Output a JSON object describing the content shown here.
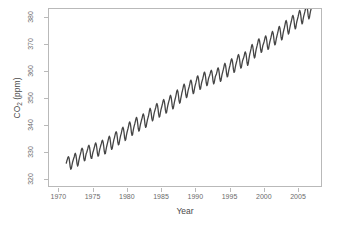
{
  "chart_data": {
    "type": "line",
    "title": "",
    "xlabel": "Year",
    "ylabel": "CO2 (ppm)",
    "ylabel_parts": {
      "base": "CO",
      "sub": "2",
      "unit": " (ppm)"
    },
    "xlim": [
      1968.5,
      2008.5
    ],
    "ylim": [
      317.0,
      383.5
    ],
    "xticks": [
      1970,
      1975,
      1980,
      1985,
      1990,
      1995,
      2000,
      2005
    ],
    "xtick_labels": [
      "1970",
      "1975",
      "1980",
      "1985",
      "1990",
      "1995",
      "2000",
      "2005"
    ],
    "yticks": [
      320,
      330,
      340,
      350,
      360,
      370,
      380
    ],
    "ytick_labels": [
      "320",
      "330",
      "340",
      "350",
      "360",
      "370",
      "380"
    ],
    "grid": false,
    "legend": null,
    "series": [
      {
        "name": "Atmospheric CO2 concentration (Mauna Loa monthly mean)",
        "color": "#454545",
        "line_width": 1.3,
        "marker": "none",
        "x": [
          1971.04,
          1971.12,
          1971.21,
          1971.29,
          1971.37,
          1971.46,
          1971.54,
          1971.62,
          1971.71,
          1971.79,
          1971.87,
          1971.96,
          1972.04,
          1972.12,
          1972.21,
          1972.29,
          1972.37,
          1972.46,
          1972.54,
          1972.62,
          1972.71,
          1972.79,
          1972.87,
          1972.96,
          1973.04,
          1973.12,
          1973.21,
          1973.29,
          1973.37,
          1973.46,
          1973.54,
          1973.62,
          1973.71,
          1973.79,
          1973.87,
          1973.96,
          1974.04,
          1974.12,
          1974.21,
          1974.29,
          1974.37,
          1974.46,
          1974.54,
          1974.62,
          1974.71,
          1974.79,
          1974.87,
          1974.96,
          1975.04,
          1975.12,
          1975.21,
          1975.29,
          1975.37,
          1975.46,
          1975.54,
          1975.62,
          1975.71,
          1975.79,
          1975.87,
          1975.96,
          1976.04,
          1976.12,
          1976.21,
          1976.29,
          1976.37,
          1976.46,
          1976.54,
          1976.62,
          1976.71,
          1976.79,
          1976.87,
          1976.96,
          1977.04,
          1977.12,
          1977.21,
          1977.29,
          1977.37,
          1977.46,
          1977.54,
          1977.62,
          1977.71,
          1977.79,
          1977.87,
          1977.96,
          1978.04,
          1978.12,
          1978.21,
          1978.29,
          1978.37,
          1978.46,
          1978.54,
          1978.62,
          1978.71,
          1978.79,
          1978.87,
          1978.96,
          1979.04,
          1979.12,
          1979.21,
          1979.29,
          1979.37,
          1979.46,
          1979.54,
          1979.62,
          1979.71,
          1979.79,
          1979.87,
          1979.96,
          1980.04,
          1980.12,
          1980.21,
          1980.29,
          1980.37,
          1980.46,
          1980.54,
          1980.62,
          1980.71,
          1980.79,
          1980.87,
          1980.96,
          1981.04,
          1981.12,
          1981.21,
          1981.29,
          1981.37,
          1981.46,
          1981.54,
          1981.62,
          1981.71,
          1981.79,
          1981.87,
          1981.96,
          1982.04,
          1982.12,
          1982.21,
          1982.29,
          1982.37,
          1982.46,
          1982.54,
          1982.62,
          1982.71,
          1982.79,
          1982.87,
          1982.96,
          1983.04,
          1983.12,
          1983.21,
          1983.29,
          1983.37,
          1983.46,
          1983.54,
          1983.62,
          1983.71,
          1983.79,
          1983.87,
          1983.96,
          1984.04,
          1984.12,
          1984.21,
          1984.29,
          1984.37,
          1984.46,
          1984.54,
          1984.62,
          1984.71,
          1984.79,
          1984.87,
          1984.96,
          1985.04,
          1985.12,
          1985.21,
          1985.29,
          1985.37,
          1985.46,
          1985.54,
          1985.62,
          1985.71,
          1985.79,
          1985.87,
          1985.96,
          1986.04,
          1986.12,
          1986.21,
          1986.29,
          1986.37,
          1986.46,
          1986.54,
          1986.62,
          1986.71,
          1986.79,
          1986.87,
          1986.96,
          1987.04,
          1987.12,
          1987.21,
          1987.29,
          1987.37,
          1987.46,
          1987.54,
          1987.62,
          1987.71,
          1987.79,
          1987.87,
          1987.96,
          1988.04,
          1988.12,
          1988.21,
          1988.29,
          1988.37,
          1988.46,
          1988.54,
          1988.62,
          1988.71,
          1988.79,
          1988.87,
          1988.96,
          1989.04,
          1989.12,
          1989.21,
          1989.29,
          1989.37,
          1989.46,
          1989.54,
          1989.62,
          1989.71,
          1989.79,
          1989.87,
          1989.96,
          1990.04,
          1990.12,
          1990.21,
          1990.29,
          1990.37,
          1990.46,
          1990.54,
          1990.62,
          1990.71,
          1990.79,
          1990.87,
          1990.96,
          1991.04,
          1991.12,
          1991.21,
          1991.29,
          1991.37,
          1991.46,
          1991.54,
          1991.62,
          1991.71,
          1991.79,
          1991.87,
          1991.96,
          1992.04,
          1992.12,
          1992.21,
          1992.29,
          1992.37,
          1992.46,
          1992.54,
          1992.62,
          1992.71,
          1992.79,
          1992.87,
          1992.96,
          1993.04,
          1993.12,
          1993.21,
          1993.29,
          1993.37,
          1993.46,
          1993.54,
          1993.62,
          1993.71,
          1993.79,
          1993.87,
          1993.96,
          1994.04,
          1994.12,
          1994.21,
          1994.29,
          1994.37,
          1994.46,
          1994.54,
          1994.62,
          1994.71,
          1994.79,
          1994.87,
          1994.96,
          1995.04,
          1995.12,
          1995.21,
          1995.29,
          1995.37,
          1995.46,
          1995.54,
          1995.62,
          1995.71,
          1995.79,
          1995.87,
          1995.96,
          1996.04,
          1996.12,
          1996.21,
          1996.29,
          1996.37,
          1996.46,
          1996.54,
          1996.62,
          1996.71,
          1996.79,
          1996.87,
          1996.96,
          1997.04,
          1997.12,
          1997.21,
          1997.29,
          1997.37,
          1997.46,
          1997.54,
          1997.62,
          1997.71,
          1997.79,
          1997.87,
          1997.96,
          1998.04,
          1998.12,
          1998.21,
          1998.29,
          1998.37,
          1998.46,
          1998.54,
          1998.62,
          1998.71,
          1998.79,
          1998.87,
          1998.96,
          1999.04,
          1999.12,
          1999.21,
          1999.29,
          1999.37,
          1999.46,
          1999.54,
          1999.62,
          1999.71,
          1999.79,
          1999.87,
          1999.96,
          2000.04,
          2000.12,
          2000.21,
          2000.29,
          2000.37,
          2000.46,
          2000.54,
          2000.62,
          2000.71,
          2000.79,
          2000.87,
          2000.96,
          2001.04,
          2001.12,
          2001.21,
          2001.29,
          2001.37,
          2001.46,
          2001.54,
          2001.62,
          2001.71,
          2001.79,
          2001.87,
          2001.96,
          2002.04,
          2002.12,
          2002.21,
          2002.29,
          2002.37,
          2002.46,
          2002.54,
          2002.62,
          2002.71,
          2002.79,
          2002.87,
          2002.96,
          2003.04,
          2003.12,
          2003.21,
          2003.29,
          2003.37,
          2003.46,
          2003.54,
          2003.62,
          2003.71,
          2003.79,
          2003.87,
          2003.96,
          2004.04,
          2004.12,
          2004.21,
          2004.29,
          2004.37,
          2004.46,
          2004.54,
          2004.62,
          2004.71,
          2004.79,
          2004.87,
          2004.96,
          2005.04,
          2005.12,
          2005.21,
          2005.29,
          2005.37,
          2005.46,
          2005.54,
          2005.62,
          2005.71,
          2005.79,
          2005.87,
          2005.96,
          2006.04,
          2006.12,
          2006.21,
          2006.29,
          2006.37,
          2006.46,
          2006.54,
          2006.62,
          2006.71,
          2006.79,
          2006.87,
          2006.96,
          2007.04,
          2007.12,
          2007.21,
          2007.29
        ],
        "y": [
          325.6,
          326.4,
          327.1,
          327.8,
          328.0,
          327.4,
          325.9,
          324.2,
          323.3,
          323.6,
          324.7,
          325.9,
          326.6,
          327.3,
          327.9,
          328.9,
          329.3,
          328.6,
          327.2,
          325.4,
          324.5,
          325.0,
          326.3,
          327.4,
          328.3,
          329.0,
          329.9,
          330.9,
          331.2,
          330.7,
          329.3,
          327.4,
          326.5,
          326.7,
          327.9,
          329.1,
          329.6,
          330.3,
          331.1,
          332.0,
          332.3,
          331.6,
          330.2,
          328.3,
          327.4,
          327.4,
          328.5,
          329.7,
          330.3,
          331.1,
          331.9,
          332.8,
          333.2,
          332.5,
          331.1,
          329.3,
          328.2,
          328.4,
          329.6,
          330.8,
          331.5,
          332.3,
          333.0,
          333.9,
          334.2,
          333.5,
          332.1,
          330.2,
          329.1,
          329.2,
          330.4,
          331.6,
          332.5,
          333.3,
          334.3,
          335.2,
          335.7,
          335.1,
          333.6,
          331.8,
          330.8,
          331.0,
          332.2,
          333.4,
          334.4,
          335.1,
          336.1,
          337.0,
          337.4,
          336.9,
          335.4,
          333.5,
          332.5,
          332.7,
          333.9,
          335.1,
          336.0,
          336.7,
          337.8,
          338.7,
          339.1,
          338.4,
          337.0,
          335.1,
          334.1,
          334.5,
          335.8,
          337.0,
          337.8,
          338.6,
          339.6,
          340.7,
          341.1,
          340.4,
          339.0,
          337.1,
          336.0,
          336.3,
          337.6,
          338.8,
          339.7,
          340.4,
          341.4,
          342.3,
          342.8,
          342.1,
          340.6,
          338.7,
          337.6,
          337.9,
          339.1,
          340.3,
          341.1,
          341.9,
          342.7,
          343.7,
          344.1,
          343.4,
          342.0,
          340.1,
          339.0,
          339.3,
          340.5,
          341.7,
          342.5,
          343.2,
          344.4,
          345.6,
          346.2,
          345.5,
          344.2,
          342.4,
          341.5,
          341.8,
          343.1,
          344.3,
          345.1,
          345.8,
          346.6,
          347.6,
          348.0,
          347.3,
          345.9,
          344.0,
          342.9,
          343.2,
          344.4,
          345.6,
          346.4,
          347.2,
          348.1,
          349.1,
          349.5,
          348.8,
          347.4,
          345.5,
          344.4,
          344.7,
          345.9,
          347.1,
          348.0,
          348.8,
          349.6,
          350.6,
          351.1,
          350.4,
          349.0,
          347.1,
          346.0,
          346.3,
          347.5,
          348.7,
          349.6,
          350.4,
          351.5,
          352.6,
          353.1,
          352.4,
          351.0,
          349.1,
          348.1,
          348.4,
          349.7,
          350.9,
          352.0,
          352.8,
          353.8,
          354.8,
          355.3,
          354.6,
          353.2,
          351.3,
          350.2,
          350.5,
          351.7,
          352.9,
          353.7,
          354.4,
          355.4,
          356.4,
          356.8,
          356.1,
          354.7,
          352.8,
          351.7,
          352.0,
          353.2,
          354.4,
          355.2,
          356.0,
          357.0,
          358.0,
          358.4,
          357.7,
          356.3,
          354.4,
          353.3,
          353.6,
          354.8,
          356.0,
          356.7,
          357.4,
          358.4,
          359.4,
          359.8,
          359.1,
          357.7,
          355.8,
          354.7,
          355.0,
          356.2,
          357.4,
          358.0,
          358.5,
          359.3,
          360.1,
          360.5,
          359.8,
          358.4,
          356.5,
          355.4,
          355.7,
          356.9,
          358.1,
          358.6,
          359.1,
          360.0,
          361.0,
          361.4,
          360.7,
          359.3,
          357.4,
          356.3,
          356.6,
          357.8,
          359.0,
          359.8,
          360.6,
          361.6,
          362.6,
          363.1,
          362.4,
          361.0,
          359.1,
          358.0,
          358.3,
          359.5,
          360.7,
          361.6,
          362.4,
          363.4,
          364.4,
          364.8,
          364.1,
          362.7,
          360.8,
          359.7,
          360.0,
          361.2,
          362.4,
          363.2,
          364.0,
          365.0,
          366.0,
          366.4,
          365.7,
          364.3,
          362.4,
          361.3,
          361.6,
          362.8,
          364.0,
          364.6,
          365.2,
          366.0,
          367.0,
          367.4,
          366.7,
          365.3,
          363.4,
          362.3,
          362.8,
          364.2,
          365.6,
          366.7,
          367.5,
          368.5,
          369.6,
          370.2,
          369.5,
          368.1,
          366.2,
          365.1,
          365.5,
          366.9,
          368.2,
          369.1,
          369.9,
          370.9,
          371.9,
          372.3,
          371.6,
          370.2,
          368.3,
          367.2,
          367.5,
          368.7,
          369.9,
          370.4,
          371.1,
          372.0,
          373.0,
          373.4,
          372.7,
          371.3,
          369.4,
          368.3,
          368.6,
          369.8,
          371.0,
          371.8,
          372.6,
          373.6,
          374.6,
          375.1,
          374.4,
          373.0,
          371.1,
          370.0,
          370.3,
          371.5,
          372.7,
          373.6,
          374.4,
          375.4,
          376.5,
          377.0,
          376.3,
          374.9,
          373.0,
          371.9,
          372.2,
          373.5,
          374.8,
          375.7,
          376.5,
          377.6,
          378.7,
          379.2,
          378.5,
          377.1,
          375.2,
          374.1,
          374.5,
          375.8,
          377.0,
          377.9,
          378.7,
          379.7,
          380.7,
          381.1,
          380.4,
          379.0,
          377.1,
          376.0,
          376.4,
          377.7,
          378.9,
          379.7,
          380.5,
          381.5,
          382.5,
          383.0,
          382.3,
          380.9,
          379.0,
          377.9,
          378.3,
          379.6,
          380.8,
          381.6,
          382.4,
          383.4,
          384.4,
          384.9,
          384.2,
          382.8,
          380.9,
          379.8,
          380.2,
          381.5,
          382.7,
          383.5,
          384.3,
          385.3,
          386.2
        ]
      }
    ]
  }
}
